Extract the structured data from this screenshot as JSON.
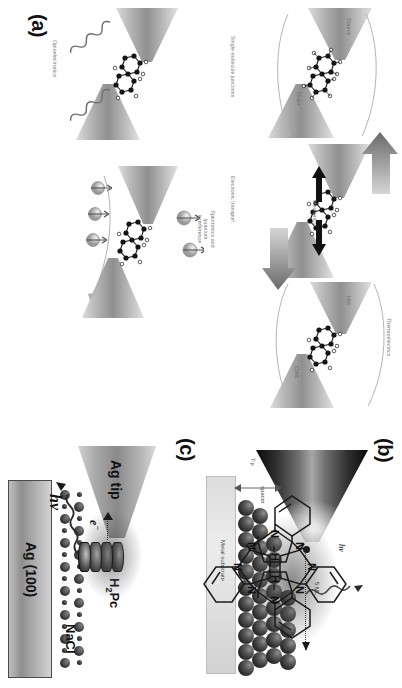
{
  "figure": {
    "orientation_deg": 90,
    "panels": [
      {
        "id": "a",
        "label": "(a)",
        "title": "Single-molecule junctions",
        "captions": [
          "Single-molecule junctions",
          "Electronic transport",
          "Mechanics",
          "Thermoelectrics",
          "Spintronics and quantum interference",
          "Optoelectronics"
        ],
        "electrode_labels": [
          "Source",
          "Drain",
          "Hot",
          "Cold"
        ]
      },
      {
        "id": "b",
        "label": "(b)",
        "labels": {
          "tip": "Tip",
          "photon": "hν",
          "thickness": "5 ML",
          "spacer": "spacer",
          "substrate": "Metal substrate",
          "bias": "+"
        }
      },
      {
        "id": "c",
        "label": "(c)",
        "labels": {
          "tip": "Ag tip",
          "molecule": "H2Pc",
          "molecule_sub": "2",
          "molecule_pre": "H",
          "molecule_post": "Pc",
          "spacer": "NaCl",
          "substrate": "Ag (100)",
          "electron": "e",
          "electron_sup": "−",
          "photon": "hν",
          "nitrogen": "N",
          "hydrogen": "H"
        }
      }
    ]
  },
  "colors": {
    "caption_gray": "#7b7b7b",
    "electrode_gray": "#8f8f8f",
    "substrate_gray": "#a8a8a8",
    "ink": "#111111",
    "background": "#ffffff"
  }
}
